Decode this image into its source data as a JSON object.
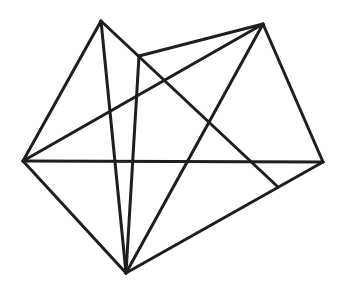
{
  "diagram": {
    "type": "geometric-figure",
    "stroke_color": "#1e1e1e",
    "background": "#ffffff",
    "vertices": {
      "A": [
        101,
        21
      ],
      "P": [
        139,
        56
      ],
      "T": [
        263,
        24
      ],
      "L": [
        23,
        161
      ],
      "R": [
        323,
        162
      ],
      "B": [
        126,
        273
      ],
      "Q": [
        278,
        187
      ]
    },
    "segments": [
      [
        "A",
        "L"
      ],
      [
        "A",
        "B"
      ],
      [
        "A",
        "Q"
      ],
      [
        "P",
        "T"
      ],
      [
        "P",
        "B"
      ],
      [
        "L",
        "T"
      ],
      [
        "L",
        "R"
      ],
      [
        "L",
        "B"
      ],
      [
        "T",
        "R"
      ],
      [
        "T",
        "B"
      ],
      [
        "B",
        "R"
      ]
    ]
  }
}
